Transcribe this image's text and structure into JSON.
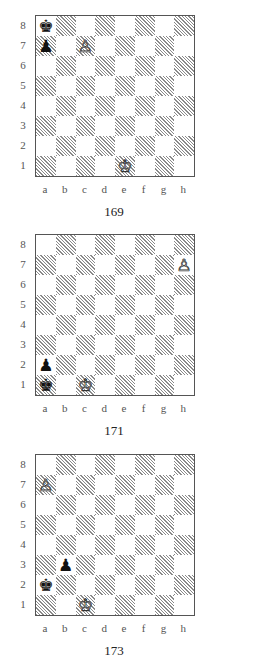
{
  "colors": {
    "frame": "#555555",
    "hatch": "#8a8a8a",
    "light": "#ffffff",
    "label": "#555555"
  },
  "ranks": [
    "8",
    "7",
    "6",
    "5",
    "4",
    "3",
    "2",
    "1"
  ],
  "files": [
    "a",
    "b",
    "c",
    "d",
    "e",
    "f",
    "g",
    "h"
  ],
  "diagrams": [
    {
      "number": "169",
      "top": 15,
      "pieces": [
        {
          "square": "a8",
          "color": "black",
          "type": "king",
          "glyph": "♚"
        },
        {
          "square": "a7",
          "color": "black",
          "type": "pawn",
          "glyph": "♟"
        },
        {
          "square": "c7",
          "color": "white",
          "type": "pawn",
          "glyph": "♙"
        },
        {
          "square": "e1",
          "color": "white",
          "type": "king",
          "glyph": "♔"
        }
      ]
    },
    {
      "number": "171",
      "top": 234,
      "pieces": [
        {
          "square": "h7",
          "color": "white",
          "type": "pawn",
          "glyph": "♙"
        },
        {
          "square": "a2",
          "color": "black",
          "type": "pawn",
          "glyph": "♟"
        },
        {
          "square": "a1",
          "color": "black",
          "type": "king",
          "glyph": "♚"
        },
        {
          "square": "c1",
          "color": "white",
          "type": "king",
          "glyph": "♔"
        }
      ]
    },
    {
      "number": "173",
      "top": 454,
      "pieces": [
        {
          "square": "a7",
          "color": "white",
          "type": "pawn",
          "glyph": "♙"
        },
        {
          "square": "b3",
          "color": "black",
          "type": "pawn",
          "glyph": "♟"
        },
        {
          "square": "a2",
          "color": "black",
          "type": "king",
          "glyph": "♚"
        },
        {
          "square": "c1",
          "color": "white",
          "type": "king",
          "glyph": "♔"
        }
      ]
    }
  ]
}
